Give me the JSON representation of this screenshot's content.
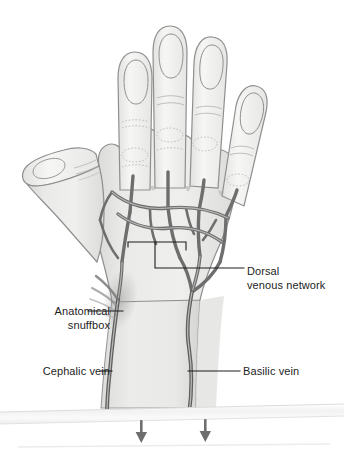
{
  "figure": {
    "view": "dorsal view of right hand and distal forearm",
    "background_color": "#ffffff"
  },
  "labels": [
    {
      "id": "dorsal-venous-network",
      "text": "Dorsal\nvenous network",
      "align": "left",
      "leader": "bracket"
    },
    {
      "id": "anatomical-snuffbox",
      "text": "Anatomical\nsnuffbox",
      "align": "right",
      "leader": "line"
    },
    {
      "id": "cephalic-vein",
      "text": "Cephalic vein",
      "align": "right",
      "leader": "line"
    },
    {
      "id": "basilic-vein",
      "text": "Basilic vein",
      "align": "left",
      "leader": "line"
    }
  ],
  "colors": {
    "skin_fill": "#e9e9e7",
    "skin_fill_light": "#f2f2f0",
    "skin_outline": "#8d8d8d",
    "vein_stroke": "#6e6e6e",
    "vein_highlight": "#c9c9c9",
    "leader_line": "#1d1d1d",
    "text": "#1d1d1d",
    "band_fill": "#f4f4f4",
    "band_edge": "#d8d8d8",
    "arrow": "#6e6e6e"
  },
  "markers": {
    "flow_arrows": [
      {
        "id": "cephalic-flow-arrow",
        "direction": "down"
      },
      {
        "id": "basilic-flow-arrow",
        "direction": "down"
      }
    ],
    "cut_band": {
      "id": "forearm-cut-band",
      "orientation": "horizontal"
    }
  }
}
